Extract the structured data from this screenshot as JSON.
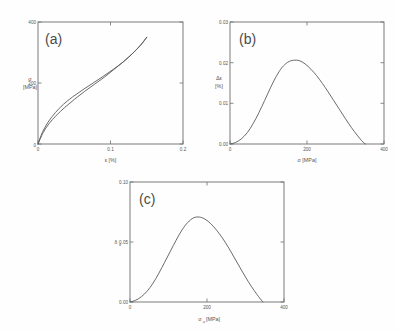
{
  "figure": {
    "background": "#fefefe",
    "curve_color": "#5a5a5a",
    "axis_color": "#6e6e6e",
    "panel_count": 3
  },
  "panels": {
    "a": {
      "tag": "(a)",
      "xlabel": "ε [%]",
      "ylabel_line1": "σ",
      "ylabel_line2": "[MPa]",
      "xticks": [
        "0",
        "0.1",
        "0.2"
      ],
      "yticks": [
        "0",
        "200",
        "400"
      ]
    },
    "b": {
      "tag": "(b)",
      "xlabel": "σ [MPa]",
      "ylabel_line1": "Δε",
      "ylabel_line2": "[%]",
      "xticks": [
        "0",
        "200",
        "400"
      ],
      "yticks": [
        "0.00",
        "0.01",
        "0.02",
        "0.03"
      ]
    },
    "c": {
      "tag": "(c)",
      "xlabel_main": "σ",
      "xlabel_sub": "a",
      "xlabel_unit": " [MPa]",
      "ylabel_main": "δ",
      "ylabel_sub": "d",
      "xticks": [
        "0",
        "200",
        "400"
      ],
      "yticks": [
        "0.00",
        "0.05",
        "0.10"
      ]
    }
  },
  "chart_data": [
    {
      "id": "a",
      "type": "line",
      "title": "(a)",
      "xlabel": "ε [%]",
      "ylabel": "σ [MPa]",
      "xlim": [
        0,
        0.2
      ],
      "ylim": [
        0,
        400
      ],
      "xticks": [
        0,
        0.1,
        0.2
      ],
      "yticks": [
        0,
        200,
        400
      ],
      "grid": false,
      "legend": false,
      "description": "Stress-strain hysteresis loop: loading branch bows above the unloading branch",
      "series": [
        {
          "name": "loading-branch",
          "x": [
            0.0,
            0.006,
            0.014,
            0.024,
            0.035,
            0.048,
            0.062,
            0.076,
            0.09,
            0.104,
            0.118,
            0.131,
            0.142,
            0.15
          ],
          "y": [
            0,
            38,
            72,
            103,
            130,
            155,
            178,
            200,
            222,
            245,
            270,
            298,
            326,
            350
          ]
        },
        {
          "name": "unloading-branch",
          "x": [
            0.15,
            0.141,
            0.13,
            0.118,
            0.105,
            0.092,
            0.078,
            0.064,
            0.05,
            0.037,
            0.025,
            0.015,
            0.007,
            0.0
          ],
          "y": [
            350,
            322,
            296,
            270,
            245,
            220,
            196,
            172,
            146,
            120,
            93,
            66,
            37,
            0
          ]
        }
      ]
    },
    {
      "id": "b",
      "type": "line",
      "title": "(b)",
      "xlabel": "σ [MPa]",
      "ylabel": "Δε [%]",
      "xlim": [
        0,
        400
      ],
      "ylim": [
        0.0,
        0.03
      ],
      "xticks": [
        0,
        200,
        400
      ],
      "yticks": [
        0.0,
        0.01,
        0.02,
        0.03
      ],
      "grid": false,
      "legend": false,
      "description": "Strain amplitude difference versus stress, peak near 180 MPa then decays to zero at ~350 MPa",
      "peak": {
        "x": 180,
        "y": 0.0205
      },
      "series": [
        {
          "name": "delta-epsilon",
          "x": [
            0,
            15,
            30,
            45,
            60,
            75,
            90,
            105,
            120,
            135,
            150,
            165,
            180,
            195,
            210,
            225,
            240,
            255,
            270,
            285,
            300,
            315,
            330,
            345,
            352
          ],
          "y": [
            0.0,
            0.0004,
            0.0013,
            0.0028,
            0.005,
            0.0077,
            0.0107,
            0.0138,
            0.0166,
            0.0188,
            0.0201,
            0.0206,
            0.0205,
            0.0197,
            0.0184,
            0.0168,
            0.0149,
            0.0128,
            0.0106,
            0.0084,
            0.0062,
            0.0041,
            0.0022,
            0.0005,
            0.0
          ]
        }
      ]
    },
    {
      "id": "c",
      "type": "line",
      "title": "(c)",
      "xlabel": "σa [MPa]",
      "ylabel": "δd",
      "xlim": [
        0,
        400
      ],
      "ylim": [
        0.0,
        0.1
      ],
      "xticks": [
        0,
        200,
        400
      ],
      "yticks": [
        0.0,
        0.05,
        0.1
      ],
      "grid": false,
      "legend": false,
      "description": "Damping parameter versus stress amplitude, peak near 170 MPa at ~0.071, decays to zero at ~345 MPa",
      "peak": {
        "x": 170,
        "y": 0.071
      },
      "series": [
        {
          "name": "damping",
          "x": [
            0,
            15,
            30,
            45,
            60,
            75,
            90,
            105,
            120,
            135,
            150,
            165,
            180,
            195,
            210,
            225,
            240,
            255,
            270,
            285,
            300,
            315,
            330,
            345
          ],
          "y": [
            0.0,
            0.0015,
            0.0045,
            0.0092,
            0.0158,
            0.024,
            0.0331,
            0.0424,
            0.0516,
            0.06,
            0.0663,
            0.0701,
            0.0708,
            0.069,
            0.0652,
            0.0598,
            0.0533,
            0.0458,
            0.0375,
            0.0291,
            0.0208,
            0.0131,
            0.0062,
            0.0
          ]
        }
      ]
    }
  ]
}
